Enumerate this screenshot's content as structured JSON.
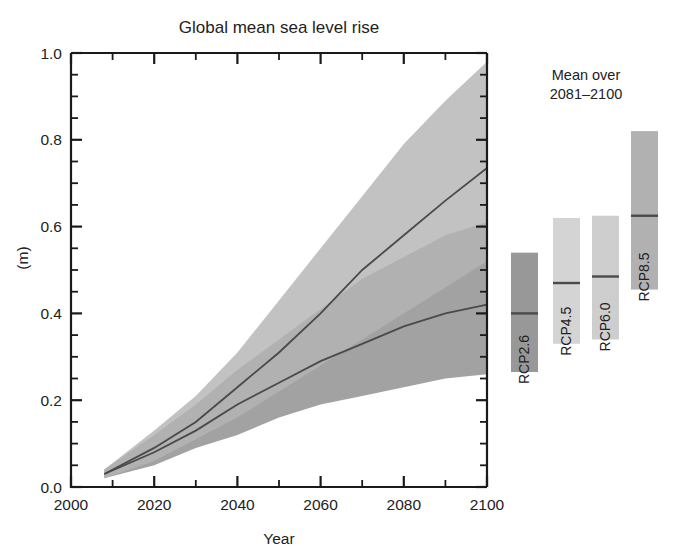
{
  "chart_data": {
    "type": "area",
    "title": "Global mean sea level rise",
    "xlabel": "Year",
    "ylabel": "(m)",
    "xlim": [
      2000,
      2100
    ],
    "ylim": [
      0.0,
      1.0
    ],
    "xticks": [
      2000,
      2020,
      2040,
      2060,
      2080,
      2100
    ],
    "yticks": [
      "0.0",
      "0.2",
      "0.4",
      "0.6",
      "0.8",
      "1.0"
    ],
    "ytick_values": [
      0.0,
      0.2,
      0.4,
      0.6,
      0.8,
      1.0
    ],
    "x_minor_step": 10,
    "y_minor_step": 0.05,
    "grid": false,
    "legend_position": "right",
    "legend_title": [
      "Mean over",
      "2081–2100"
    ],
    "series": [
      {
        "name": "RCP8.5",
        "style": "envelope",
        "color": "#b4b4b4",
        "x": [
          2008,
          2020,
          2030,
          2040,
          2050,
          2060,
          2070,
          2080,
          2090,
          2100
        ],
        "median": [
          0.03,
          0.09,
          0.15,
          0.23,
          0.31,
          0.4,
          0.5,
          0.58,
          0.66,
          0.735
        ],
        "upper": [
          0.04,
          0.13,
          0.21,
          0.31,
          0.43,
          0.55,
          0.67,
          0.79,
          0.89,
          0.98
        ],
        "lower": [
          0.02,
          0.06,
          0.11,
          0.16,
          0.22,
          0.28,
          0.34,
          0.4,
          0.46,
          0.52
        ]
      },
      {
        "name": "RCP2.6",
        "style": "envelope",
        "color": "#8d8d8d",
        "x": [
          2008,
          2020,
          2030,
          2040,
          2050,
          2060,
          2070,
          2080,
          2090,
          2100
        ],
        "median": [
          0.03,
          0.08,
          0.13,
          0.19,
          0.24,
          0.29,
          0.33,
          0.37,
          0.4,
          0.42
        ],
        "upper": [
          0.04,
          0.12,
          0.19,
          0.27,
          0.34,
          0.41,
          0.48,
          0.53,
          0.58,
          0.61
        ],
        "lower": [
          0.02,
          0.05,
          0.09,
          0.12,
          0.16,
          0.19,
          0.21,
          0.23,
          0.25,
          0.26
        ]
      }
    ],
    "bars": [
      {
        "name": "RCP2.6",
        "low": 0.265,
        "high": 0.54,
        "median": 0.4,
        "color": "#8d8d8d"
      },
      {
        "name": "RCP4.5",
        "low": 0.33,
        "high": 0.62,
        "median": 0.47,
        "color": "#cfcfcf"
      },
      {
        "name": "RCP6.0",
        "low": 0.34,
        "high": 0.625,
        "median": 0.485,
        "color": "#c9c9c9"
      },
      {
        "name": "RCP8.5",
        "low": 0.455,
        "high": 0.82,
        "median": 0.625,
        "color": "#a8a8a8"
      }
    ],
    "median_line_color": "#4a4a4a",
    "axis_color": "#1a1a1a"
  }
}
